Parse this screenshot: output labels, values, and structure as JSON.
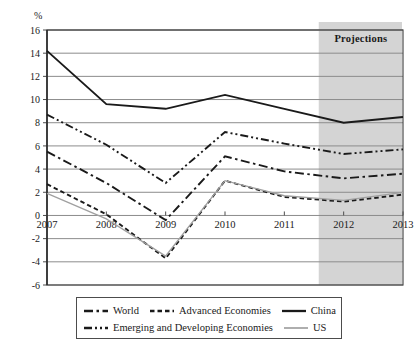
{
  "axis": {
    "unit": "%",
    "ylabel": "",
    "xlabel": "",
    "yticks": [
      "16",
      "14",
      "12",
      "10",
      "8",
      "6",
      "4",
      "2",
      "0",
      "-2",
      "-4",
      "-6"
    ],
    "xticks": [
      "2007",
      "2008",
      "2009",
      "2010",
      "2011",
      "2012",
      "2013"
    ]
  },
  "annotation": {
    "projections_label": "Projections",
    "projections_band_color": "#d4d4d4"
  },
  "legend": {
    "rows": [
      [
        {
          "name": "World",
          "style": "dash-dot-long"
        },
        {
          "name": "Advanced Economies",
          "style": "dash-short"
        },
        {
          "name": "China",
          "style": "solid-thick"
        }
      ],
      [
        {
          "name": "Emerging and Developing Economies",
          "style": "dash-dot-dot"
        },
        {
          "name": "US",
          "style": "solid-thin-gray"
        }
      ]
    ]
  },
  "chart_data": {
    "type": "line",
    "title": "",
    "xlabel": "",
    "ylabel": "%",
    "x": [
      "2007",
      "2008",
      "2009",
      "2010",
      "2011",
      "2012",
      "2013"
    ],
    "xlim": [
      "2007",
      "2013"
    ],
    "ylim": [
      -6,
      16
    ],
    "ytick_step": 2,
    "grid": true,
    "legend_position": "bottom",
    "projection_start": "2012",
    "series": [
      {
        "name": "China",
        "color": "#1a1a1a",
        "style": "solid-thick",
        "values": [
          14.2,
          9.6,
          9.2,
          10.4,
          9.2,
          8.0,
          8.5
        ]
      },
      {
        "name": "Emerging and Developing Economies",
        "color": "#1a1a1a",
        "style": "dash-dot-dot",
        "values": [
          8.7,
          6.1,
          2.8,
          7.2,
          6.2,
          5.3,
          5.7
        ]
      },
      {
        "name": "World",
        "color": "#1a1a1a",
        "style": "dash-dot-long",
        "values": [
          5.5,
          2.8,
          -0.4,
          5.1,
          3.8,
          3.2,
          3.6
        ]
      },
      {
        "name": "Advanced Economies",
        "color": "#1a1a1a",
        "style": "dash-short",
        "values": [
          2.7,
          0.1,
          -3.7,
          3.0,
          1.6,
          1.2,
          1.8
        ]
      },
      {
        "name": "US",
        "color": "#a0a0a0",
        "style": "solid-thin-gray",
        "values": [
          1.9,
          -0.3,
          -3.5,
          3.0,
          1.7,
          1.3,
          2.0
        ]
      }
    ]
  }
}
